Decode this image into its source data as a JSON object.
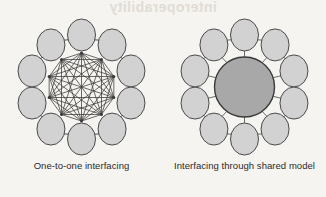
{
  "page": {
    "background_color": "#f6f4f0",
    "bleed_through_text": "interoperability"
  },
  "figures": [
    {
      "id": "one-to-one",
      "caption": "One-to-one interfacing",
      "node_count": 10,
      "has_hub": false,
      "topology": "complete-graph",
      "node_fill": "#d2d2d2",
      "node_stroke": "#4a4a4a",
      "edge_color": "#3a3a3a"
    },
    {
      "id": "shared-model",
      "caption": "Interfacing through shared model",
      "node_count": 10,
      "has_hub": true,
      "topology": "star-with-ring",
      "node_fill": "#d2d2d2",
      "node_stroke": "#4a4a4a",
      "hub_fill": "#a8a8a8",
      "hub_stroke": "#3a3a3a",
      "edge_color": "#5a5a5a"
    }
  ],
  "geometry": {
    "ring_center_x": 81.5,
    "ring_center_y": 75,
    "ring_radius": 52,
    "node_rx": 14,
    "node_ry": 16,
    "mesh_anchor_radius": 34,
    "hub_radius": 30,
    "start_angle_deg": -90
  }
}
